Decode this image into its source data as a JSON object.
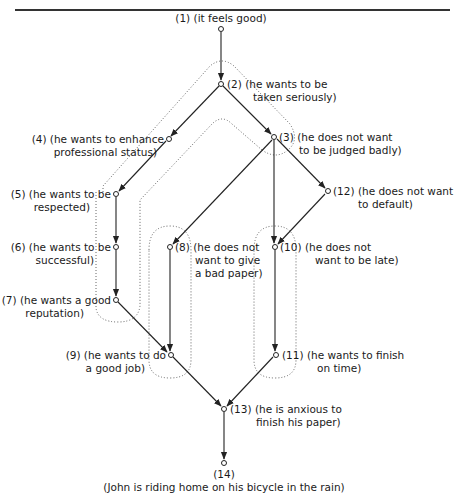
{
  "diagram": {
    "nodes": [
      {
        "id": "1",
        "label_line1": "(1) (it feels good)",
        "label_line2": ""
      },
      {
        "id": "2",
        "label_line1": "(2) (he wants to be",
        "label_line2": "taken seriously)"
      },
      {
        "id": "3",
        "label_line1": "(3) (he does not want",
        "label_line2": "to be judged badly)"
      },
      {
        "id": "4",
        "label_line1": "(4) (he wants to enhance",
        "label_line2": "professional status)"
      },
      {
        "id": "5",
        "label_line1": "(5) (he wants to be",
        "label_line2": "respected)"
      },
      {
        "id": "6",
        "label_line1": "(6) (he wants to be",
        "label_line2": "successful)"
      },
      {
        "id": "7",
        "label_line1": "(7) (he wants a good",
        "label_line2": "reputation)"
      },
      {
        "id": "8",
        "label_line1": "(8) (he does not",
        "label_line2": "want to give",
        "label_line3": "a bad paper)"
      },
      {
        "id": "9",
        "label_line1": "(9) (he wants to do",
        "label_line2": "a good job)"
      },
      {
        "id": "10",
        "label_line1": "(10) (he does not",
        "label_line2": "want to be late)"
      },
      {
        "id": "11",
        "label_line1": "(11) (he wants to finish",
        "label_line2": "on time)"
      },
      {
        "id": "12",
        "label_line1": "(12) (he does not want",
        "label_line2": "to default)"
      },
      {
        "id": "13",
        "label_line1": "(13) (he is anxious to",
        "label_line2": "finish his paper)"
      },
      {
        "id": "14",
        "label_line1": "(14)",
        "label_line2": "(John is riding home on his bicycle in the rain)"
      }
    ],
    "edges": [
      [
        "1",
        "2"
      ],
      [
        "2",
        "4"
      ],
      [
        "2",
        "3"
      ],
      [
        "4",
        "5"
      ],
      [
        "5",
        "6"
      ],
      [
        "6",
        "7"
      ],
      [
        "3",
        "8"
      ],
      [
        "3",
        "10"
      ],
      [
        "3",
        "12"
      ],
      [
        "12",
        "10"
      ],
      [
        "8",
        "9"
      ],
      [
        "7",
        "9"
      ],
      [
        "10",
        "11"
      ],
      [
        "9",
        "13"
      ],
      [
        "11",
        "13"
      ],
      [
        "13",
        "14"
      ]
    ],
    "groupings": [
      {
        "name": "outer-loop-2",
        "style": "dotted"
      },
      {
        "name": "inner-loop-3-5-6-7",
        "style": "dotted"
      },
      {
        "name": "loop-8-9",
        "style": "dotted"
      },
      {
        "name": "loop-10-11",
        "style": "dotted"
      }
    ]
  }
}
